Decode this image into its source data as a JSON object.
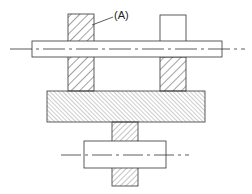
{
  "diagram": {
    "type": "mechanical-section-drawing",
    "labels": {
      "part_a": "(A)"
    },
    "colors": {
      "line": "#333333",
      "hatch": "#444444",
      "background": "#ffffff"
    },
    "parts": [
      {
        "name": "upper-shaft",
        "hatched": false
      },
      {
        "name": "left-support-block",
        "hatched": true,
        "callout": "(A)"
      },
      {
        "name": "right-support-block",
        "hatched": "lower-half"
      },
      {
        "name": "base-plate",
        "hatched": true
      },
      {
        "name": "lower-post",
        "hatched": true
      },
      {
        "name": "lower-shaft",
        "hatched": false
      }
    ]
  }
}
